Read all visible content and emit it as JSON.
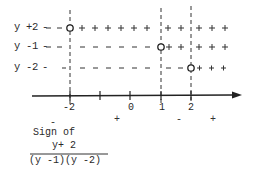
{
  "rows": [
    {
      "label": "y +2 -",
      "signs_left_of_zero": "- -",
      "factor": "y+2",
      "zero_at": -2,
      "y": 28,
      "segments": [
        {
          "from": 38,
          "to": 66,
          "text": "- -"
        },
        {
          "from": 75,
          "to": 158,
          "text": "+ + + + + +"
        },
        {
          "from": 164,
          "to": 188,
          "text": "+ +"
        },
        {
          "from": 194,
          "to": 240,
          "text": "+ + +"
        }
      ]
    },
    {
      "label": "y -1 -",
      "factor": "y-1",
      "zero_at": 1,
      "y": 47,
      "segments": [
        {
          "from": 38,
          "to": 66,
          "text": "- -"
        },
        {
          "from": 75,
          "to": 156,
          "text": "- - - - - - - -"
        },
        {
          "from": 166,
          "to": 188,
          "text": "+ +"
        },
        {
          "from": 194,
          "to": 240,
          "text": "+ + +"
        }
      ]
    },
    {
      "label": "y -2 -",
      "factor": "y-2",
      "zero_at": 2,
      "y": 68,
      "segments": [
        {
          "from": 38,
          "to": 66,
          "text": "-"
        },
        {
          "from": 75,
          "to": 156,
          "text": "- - - - - - - -"
        },
        {
          "from": 164,
          "to": 186,
          "text": "- -"
        },
        {
          "from": 196,
          "to": 240,
          "text": "+ + +"
        }
      ]
    }
  ],
  "axis": {
    "ticks": [
      {
        "value": -2,
        "label": "-2",
        "x": 70
      },
      {
        "value": -1,
        "label": "",
        "x": 100
      },
      {
        "value": 0,
        "label": "0",
        "x": 130
      },
      {
        "value": 1,
        "label": "1",
        "x": 161
      },
      {
        "value": 2,
        "label": "2",
        "x": 191
      }
    ]
  },
  "result_signs": [
    {
      "text": "-",
      "x": 52
    },
    {
      "text": "+",
      "x": 116
    },
    {
      "text": "-",
      "x": 177
    },
    {
      "text": "+",
      "x": 212
    }
  ],
  "caption": {
    "line1": "Sign of",
    "numerator": "y+ 2",
    "denominator": "(y -1)(y -2)"
  },
  "labels": {
    "row1": "y +2",
    "row2": "y -1",
    "row3": "y -2",
    "tick_m2": "-2",
    "tick_0": "0",
    "tick_1": "1",
    "tick_2": "2",
    "sign1": "-",
    "sign2": "+",
    "sign3": "-",
    "sign4": "+"
  }
}
